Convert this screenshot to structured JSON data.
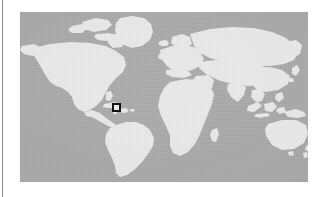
{
  "figure": {
    "kind": "world-map-locator",
    "map": {
      "projection": "equirectangular",
      "ocean_color": "#a9a9a9",
      "land_color": "#e9e9e9",
      "frame": {
        "x": 20,
        "y": 12,
        "width": 288,
        "height": 170
      }
    },
    "marker": {
      "kind": "highlight-box",
      "shape": "square",
      "border_color": "#131313",
      "fill_color": "#ebebeb",
      "size_px": 9,
      "region": "Caribbean / Lesser Antilles",
      "position_px": {
        "x": 92,
        "y": 91
      }
    },
    "landmasses": [
      "North America",
      "Greenland",
      "South America",
      "Africa",
      "Europe",
      "Asia",
      "Australia",
      "Southeast Asian islands",
      "Japan",
      "Madagascar",
      "New Zealand",
      "Iceland",
      "British Isles",
      "Caribbean islands"
    ],
    "margin_rule": {
      "kind": "page-edge-rule",
      "color": "#8d8d8d",
      "x": 2,
      "width": 1
    }
  }
}
